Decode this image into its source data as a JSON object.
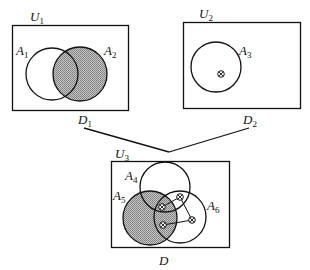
{
  "diagram": {
    "type": "venn-composition",
    "colors": {
      "stroke": "#111111",
      "shade": "#a8a8a8",
      "background": "#ffffff"
    },
    "panels": [
      {
        "id": "D1",
        "universe_label": {
          "base": "U",
          "sub": "1"
        },
        "domain_label": {
          "base": "D",
          "sub": "1"
        },
        "sets": [
          {
            "base": "A",
            "sub": "1",
            "shaded": false
          },
          {
            "base": "A",
            "sub": "2",
            "shaded": true
          }
        ],
        "points": []
      },
      {
        "id": "D2",
        "universe_label": {
          "base": "U",
          "sub": "2"
        },
        "domain_label": {
          "base": "D",
          "sub": "2"
        },
        "sets": [
          {
            "base": "A",
            "sub": "3",
            "shaded": false
          }
        ],
        "points": [
          {
            "symbol": "⊗",
            "in": "A3"
          }
        ]
      },
      {
        "id": "D",
        "universe_label": {
          "base": "U",
          "sub": "3"
        },
        "domain_label": {
          "base": "D",
          "sub": ""
        },
        "sets": [
          {
            "base": "A",
            "sub": "4",
            "shaded": false
          },
          {
            "base": "A",
            "sub": "5",
            "shaded": true
          },
          {
            "base": "A",
            "sub": "6",
            "shaded": false
          }
        ],
        "points": [
          {
            "symbol": "⊗",
            "in": "A4∩A5∩A6"
          },
          {
            "symbol": "⊗",
            "in": "A4∩A6"
          },
          {
            "symbol": "⊗",
            "in": "A6"
          },
          {
            "symbol": "⊗",
            "in": "A5∩A6"
          }
        ],
        "point_chain": "connected by line segments"
      }
    ],
    "composition": "D1 and D2 combine into D"
  }
}
